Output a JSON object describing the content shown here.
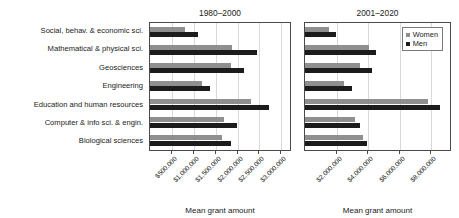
{
  "chart_data": {
    "type": "bar",
    "orientation": "horizontal",
    "title": "",
    "xlabel": "Mean grant amount",
    "ylabel": "",
    "grid": true,
    "legend_position": "top-right (panel 2)",
    "legend": [
      {
        "name": "Women",
        "color": "#8f8f8f"
      },
      {
        "name": "Men",
        "color": "#1c1c1c"
      }
    ],
    "categories": [
      "Social, behav. & economic sci.",
      "Mathematical & physical sci.",
      "Geosciences",
      "Engineering",
      "Education and human resources",
      "Computer & info sci. & engin.",
      "Biological sciences"
    ],
    "panels": [
      {
        "title": "1980–2000",
        "xlabel": "Mean grant amount",
        "xlim": [
          0,
          3200000
        ],
        "xticks": [
          500000,
          1000000,
          1500000,
          2000000,
          2500000,
          3000000
        ],
        "xticklabels": [
          "$500,000",
          "$1,000,000",
          "$1,500,000",
          "$2,000,000",
          "$2,500,000",
          "$3,000,000"
        ],
        "series": [
          {
            "name": "Women",
            "color": "#8f8f8f",
            "values": [
              810000,
              1880000,
              1850000,
              1190000,
              2300000,
              1700000,
              1640000
            ]
          },
          {
            "name": "Men",
            "color": "#1c1c1c",
            "values": [
              1090000,
              2450000,
              2150000,
              1370000,
              2720000,
              1980000,
              1840000
            ]
          }
        ]
      },
      {
        "title": "2001–2020",
        "xlabel": "Mean grant amount",
        "xlim": [
          0,
          9200000
        ],
        "xticks": [
          2000000,
          4000000,
          6000000,
          8000000
        ],
        "xticklabels": [
          "$2,000,000",
          "$4,000,000",
          "$6,000,000",
          "$8,000,000"
        ],
        "series": [
          {
            "name": "Women",
            "color": "#8f8f8f",
            "values": [
              1540000,
              4050000,
              3520000,
              2470000,
              7800000,
              3200000,
              3680000
            ]
          },
          {
            "name": "Men",
            "color": "#1c1c1c",
            "values": [
              1980000,
              4480000,
              4230000,
              2980000,
              8550000,
              3480000,
              3960000
            ]
          }
        ]
      }
    ]
  }
}
